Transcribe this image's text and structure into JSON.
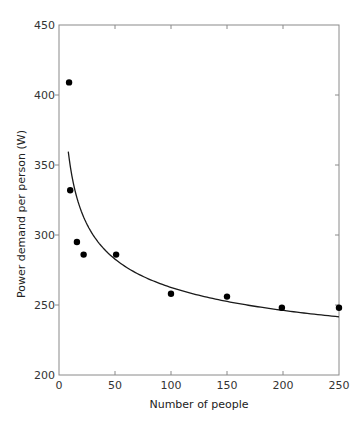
{
  "chart_data": {
    "type": "scatter",
    "title": "",
    "xlabel": "Number of people",
    "ylabel": "Power demand per person (W)",
    "xlim": [
      0,
      250
    ],
    "ylim": [
      200,
      450
    ],
    "xticks": [
      0,
      50,
      100,
      150,
      200,
      250
    ],
    "yticks": [
      200,
      250,
      300,
      350,
      400,
      450
    ],
    "grid": false,
    "legend": null,
    "series": [
      {
        "name": "Observed",
        "type": "scatter",
        "color": "#000000",
        "points": [
          {
            "x": 9,
            "y": 409
          },
          {
            "x": 10,
            "y": 332
          },
          {
            "x": 16,
            "y": 295
          },
          {
            "x": 22,
            "y": 286
          },
          {
            "x": 51,
            "y": 286
          },
          {
            "x": 100,
            "y": 258
          },
          {
            "x": 150,
            "y": 256
          },
          {
            "x": 199,
            "y": 248
          },
          {
            "x": 250,
            "y": 248
          }
        ]
      },
      {
        "name": "Fitted curve",
        "type": "line",
        "color": "#1a1a1a",
        "model": "y = 175.2 + 347.8 * x^-0.3",
        "x_range": [
          8.3,
          250
        ],
        "points": [
          {
            "x": 8.3,
            "y": 359.5
          },
          {
            "x": 20,
            "y": 319.7
          },
          {
            "x": 50,
            "y": 282.9
          },
          {
            "x": 100,
            "y": 262.6
          },
          {
            "x": 150,
            "y": 252.9
          },
          {
            "x": 200,
            "y": 246.5
          },
          {
            "x": 250,
            "y": 241.6
          }
        ]
      }
    ]
  }
}
